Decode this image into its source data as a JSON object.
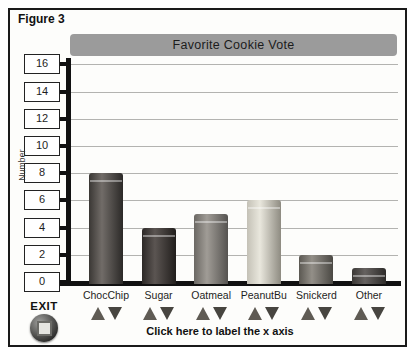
{
  "figure_label": "Figure 3",
  "title_bar": {
    "text": "Favorite Cookie Vote",
    "bg": "#9b9b9b"
  },
  "y_axis": {
    "label": "Number",
    "tick_labels": [
      16,
      14,
      12,
      10,
      8,
      6,
      4,
      2,
      0
    ]
  },
  "x_axis": {
    "hint": "Click here to label the x axis"
  },
  "exit": {
    "label": "EXIT"
  },
  "controls": {
    "up_icon": "triangle-up",
    "down_icon": "triangle-down",
    "up_color": "#5f5b54",
    "down_color": "#474540"
  },
  "chart_data": {
    "type": "bar",
    "title": "Favorite Cookie Vote",
    "categories": [
      "ChocChip",
      "Sugar",
      "Oatmeal",
      "PeanutBu",
      "Snickerd",
      "Other"
    ],
    "values": [
      8,
      4,
      5,
      6,
      2,
      1
    ],
    "xlabel": "",
    "ylabel": "Number",
    "ylim": [
      0,
      16
    ],
    "ytick_step": 2,
    "grid": true,
    "legend": false,
    "bar_colors": [
      {
        "left": "#3a3734",
        "mid": "#716c68",
        "right": "#2b2927"
      },
      {
        "left": "#2c2826",
        "mid": "#5b5552",
        "right": "#211e1c"
      },
      {
        "left": "#6b6863",
        "mid": "#a09c96",
        "right": "#555350"
      },
      {
        "left": "#c4c1b6",
        "mid": "#e9e7dd",
        "right": "#8e8b81"
      },
      {
        "left": "#5b5852",
        "mid": "#938f88",
        "right": "#4a4843"
      },
      {
        "left": "#3b3835",
        "mid": "#666260",
        "right": "#2d2b29"
      }
    ]
  }
}
